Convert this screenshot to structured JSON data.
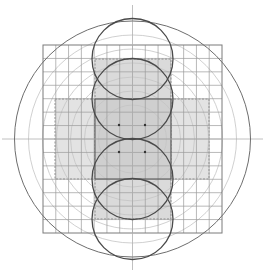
{
  "diagram": {
    "title": "",
    "grid_cells_per_side": 14,
    "stacked_circle_count": 4,
    "concentric_ring_count": 6,
    "center_dot_count": 4,
    "colors": {
      "background": "#ffffff",
      "outer_circle": "#6e6e6e",
      "grid_line": "#9a9a9a",
      "grid_border": "#7a7a7a",
      "stacked_circle": "#4a4a4a",
      "concentric_ring": "#c4c4c4",
      "band_fill": "#e3e3e3",
      "center_fill": "#cfcfcf",
      "vertical_strip_fill": "#dadada",
      "axis_line": "#b0b0b0",
      "strip_border": "#555555",
      "dot": "#333333"
    }
  }
}
